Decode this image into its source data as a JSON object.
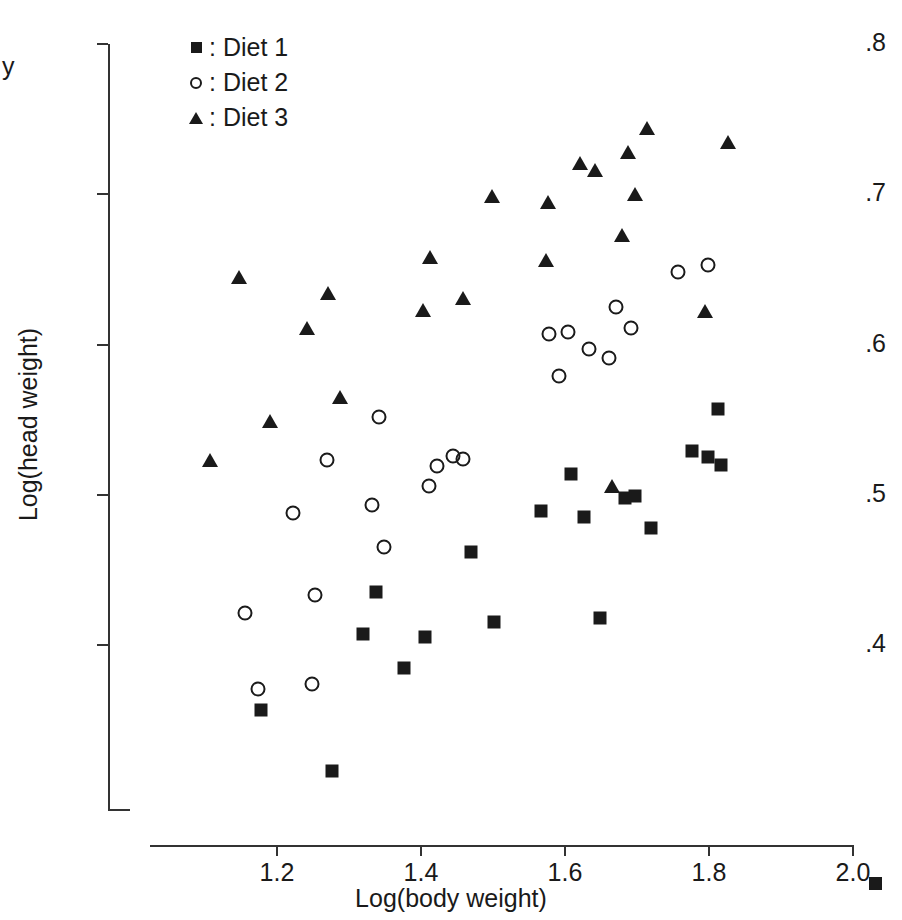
{
  "figure": {
    "background": "#ffffff",
    "foreground": "#1a1a1a"
  },
  "legend": {
    "position": "top-left-inside",
    "items": [
      {
        "marker": "filled-square-icon",
        "shape": "square",
        "label": ": Diet 1"
      },
      {
        "marker": "open-circle-icon",
        "shape": "circle",
        "label": ": Diet 2"
      },
      {
        "marker": "filled-triangle-icon",
        "shape": "triangle",
        "label": ": Diet 3"
      }
    ]
  },
  "axes": {
    "x": {
      "title": "Log(body weight)",
      "ticks": [
        "1.2",
        "1.4",
        "1.6",
        "1.8",
        "2.0"
      ],
      "tick_values": [
        1.2,
        1.4,
        1.6,
        1.8,
        2.0
      ],
      "min": 1.14,
      "max": 2.0
    },
    "y": {
      "title": "Log(head weight)",
      "title_stub": "y",
      "ticks": [
        ".8",
        ".7",
        ".6",
        ".5",
        ".4"
      ],
      "tick_values": [
        0.8,
        0.7,
        0.6,
        0.5,
        0.4
      ],
      "min": 0.29,
      "max": 0.8
    }
  },
  "chart_data": {
    "type": "scatter",
    "title": "",
    "xlabel": "Log(body weight)",
    "ylabel": "Log(head weight)",
    "xlim": [
      1.14,
      2.0
    ],
    "ylim": [
      0.29,
      0.8
    ],
    "grid": false,
    "legend_position": "upper left",
    "series": [
      {
        "name": "Diet 1",
        "marker": "square",
        "filled": true,
        "color": "#1a1a1a",
        "points": [
          [
            1.276,
            0.316
          ],
          [
            1.178,
            0.357
          ],
          [
            1.377,
            0.385
          ],
          [
            1.405,
            0.405
          ],
          [
            1.32,
            0.407
          ],
          [
            1.501,
            0.415
          ],
          [
            1.648,
            0.418
          ],
          [
            1.337,
            0.435
          ],
          [
            1.47,
            0.462
          ],
          [
            1.719,
            0.478
          ],
          [
            1.627,
            0.485
          ],
          [
            1.567,
            0.489
          ],
          [
            1.683,
            0.498
          ],
          [
            1.697,
            0.499
          ],
          [
            1.609,
            0.514
          ],
          [
            1.816,
            0.52
          ],
          [
            1.798,
            0.525
          ],
          [
            1.777,
            0.529
          ],
          [
            1.812,
            0.557
          ]
        ]
      },
      {
        "name": "Diet 2",
        "marker": "circle",
        "filled": false,
        "color": "#1a1a1a",
        "points": [
          [
            1.173,
            0.371
          ],
          [
            1.248,
            0.374
          ],
          [
            1.155,
            0.421
          ],
          [
            1.253,
            0.433
          ],
          [
            1.348,
            0.465
          ],
          [
            1.332,
            0.493
          ],
          [
            1.222,
            0.488
          ],
          [
            1.411,
            0.506
          ],
          [
            1.422,
            0.519
          ],
          [
            1.444,
            0.526
          ],
          [
            1.459,
            0.524
          ],
          [
            1.27,
            0.523
          ],
          [
            1.341,
            0.552
          ],
          [
            1.591,
            0.579
          ],
          [
            1.661,
            0.591
          ],
          [
            1.634,
            0.597
          ],
          [
            1.578,
            0.607
          ],
          [
            1.604,
            0.608
          ],
          [
            1.691,
            0.611
          ],
          [
            1.671,
            0.625
          ],
          [
            1.757,
            0.648
          ],
          [
            1.799,
            0.653
          ]
        ]
      },
      {
        "name": "Diet 3",
        "marker": "triangle",
        "filled": true,
        "color": "#1a1a1a",
        "points": [
          [
            1.107,
            0.523
          ],
          [
            1.19,
            0.549
          ],
          [
            1.287,
            0.565
          ],
          [
            1.241,
            0.611
          ],
          [
            1.403,
            0.623
          ],
          [
            1.459,
            0.631
          ],
          [
            1.271,
            0.634
          ],
          [
            1.147,
            0.645
          ],
          [
            1.573,
            0.656
          ],
          [
            1.413,
            0.658
          ],
          [
            1.665,
            0.506
          ],
          [
            1.679,
            0.673
          ],
          [
            1.577,
            0.695
          ],
          [
            1.499,
            0.699
          ],
          [
            1.697,
            0.7
          ],
          [
            1.621,
            0.721
          ],
          [
            1.687,
            0.728
          ],
          [
            1.827,
            0.735
          ],
          [
            1.714,
            0.744
          ],
          [
            1.795,
            0.622
          ],
          [
            1.641,
            0.716
          ]
        ]
      }
    ]
  }
}
